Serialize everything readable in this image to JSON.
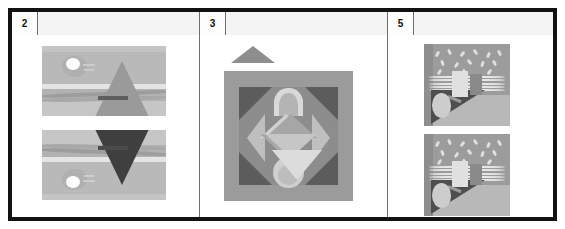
{
  "document": {
    "clipped_top_text": "",
    "type": "table"
  },
  "table": {
    "columns": [
      {
        "number": "2",
        "header_label": ""
      },
      {
        "number": "3",
        "header_label": ""
      },
      {
        "number": "5",
        "header_label": ""
      }
    ],
    "border_color": "#121212",
    "grid_color": "#6e6e6e",
    "header_bg": "#f4f4f4",
    "cell_bg": "#ffffff"
  },
  "cells": {
    "column_2": {
      "name": "column-2-content",
      "images": [
        {
          "name": "landscape-thumbnail-upright",
          "description": "Grayscale landscape: sun with rays, triangular mountain, horizon band, wavy ground lines",
          "orientation": "upright"
        },
        {
          "name": "landscape-thumbnail-flipped",
          "description": "Same landscape flipped vertically with dark triangle and white sun at lower right",
          "orientation": "flipped-vertical"
        }
      ]
    },
    "column_3": {
      "name": "column-3-content",
      "shapes": [
        {
          "name": "standalone-triangle",
          "description": "Solid gray isosceles triangle above the main artwork"
        }
      ],
      "images": [
        {
          "name": "geometric-mandala",
          "description": "Square grayscale composition: dark corner wedges, central faceted hexagon/star, arc above and sphere below",
          "orientation": "upright"
        }
      ]
    },
    "column_5": {
      "name": "column-5-content",
      "images": [
        {
          "name": "still-life-thumbnail-top",
          "description": "Grayscale still life: speckled wall, horizontal wavy lines, light card and dark card, egg shape with diagonal shadow",
          "orientation": "upright"
        },
        {
          "name": "still-life-thumbnail-bottom",
          "description": "Near-duplicate of the still life composition above",
          "orientation": "upright"
        }
      ]
    }
  },
  "palette": {
    "frame": "#121212",
    "grid": "#6e6e6e",
    "background": "#ffffff",
    "art_light": "#e0e0e0",
    "art_mid": "#9c9c9c",
    "art_dark": "#4e4e4e"
  }
}
